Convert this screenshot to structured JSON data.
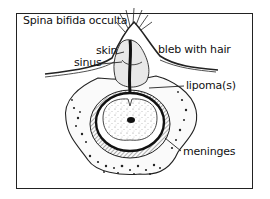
{
  "figure": {
    "title": "Spina bifida occulta",
    "labels": {
      "skin": "skin",
      "sinus": "sinus",
      "bleb": "bleb with hair",
      "lipoma": "lipoma(s)",
      "meninges": "meninges"
    }
  }
}
